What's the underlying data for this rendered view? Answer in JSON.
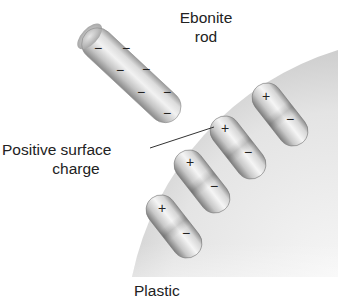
{
  "diagram": {
    "type": "electrostatic-induction-illustration",
    "labels": {
      "rod_line1": "Ebonite",
      "rod_line2": "rod",
      "surface_line1": "Positive surface",
      "surface_line2": "charge",
      "plastic": "Plastic"
    },
    "rod": {
      "name": "Ebonite rod",
      "charge_symbols": [
        "−",
        "−",
        "−",
        "−",
        "−",
        "−",
        "−"
      ]
    },
    "dipoles": [
      {
        "positive": "+",
        "negative": "−"
      },
      {
        "positive": "+",
        "negative": "−"
      },
      {
        "positive": "+",
        "negative": "−"
      },
      {
        "positive": "+",
        "negative": "−"
      }
    ],
    "colors": {
      "background": "#ffffff",
      "text": "#222222",
      "plastic_light": "#f2f2f2",
      "plastic_dark": "#b5b5b5",
      "capsule_light": "#f4f4f4",
      "capsule_dark": "#9a9a9a",
      "leader_line": "#333333"
    }
  }
}
